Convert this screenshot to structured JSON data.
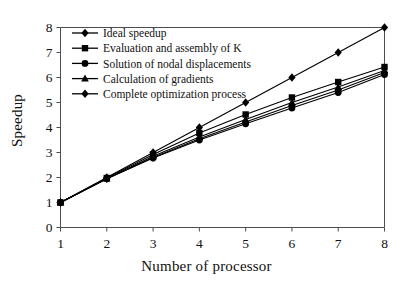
{
  "chart_data": {
    "type": "line",
    "title": "",
    "xlabel": "Number of processor",
    "ylabel": "Speedup",
    "x": [
      1,
      2,
      3,
      4,
      5,
      6,
      7,
      8
    ],
    "xlim": [
      1,
      8
    ],
    "ylim": [
      0,
      8
    ],
    "xticks": [
      "1",
      "2",
      "3",
      "4",
      "5",
      "6",
      "7",
      "8"
    ],
    "yticks": [
      "0",
      "1",
      "2",
      "3",
      "4",
      "5",
      "6",
      "7",
      "8"
    ],
    "grid": false,
    "legend_position": "upper-left",
    "series": [
      {
        "name": "Ideal speedup",
        "marker": "diamond",
        "values": [
          1.0,
          2.0,
          3.0,
          4.0,
          5.0,
          6.0,
          7.0,
          8.0
        ]
      },
      {
        "name": "Evaluation and assembly of K",
        "marker": "square",
        "values": [
          1.0,
          1.98,
          2.92,
          3.78,
          4.52,
          5.2,
          5.82,
          6.42
        ]
      },
      {
        "name": "Solution of nodal displacements",
        "marker": "circle",
        "values": [
          1.0,
          1.95,
          2.78,
          3.5,
          4.15,
          4.78,
          5.4,
          6.12
        ]
      },
      {
        "name": "Calculation of gradients",
        "marker": "triangle",
        "values": [
          1.0,
          1.96,
          2.85,
          3.62,
          4.32,
          5.0,
          5.62,
          6.28
        ]
      },
      {
        "name": "Complete optimization process",
        "marker": "diamond",
        "values": [
          1.0,
          1.95,
          2.8,
          3.55,
          4.22,
          4.88,
          5.5,
          6.2
        ]
      }
    ]
  }
}
